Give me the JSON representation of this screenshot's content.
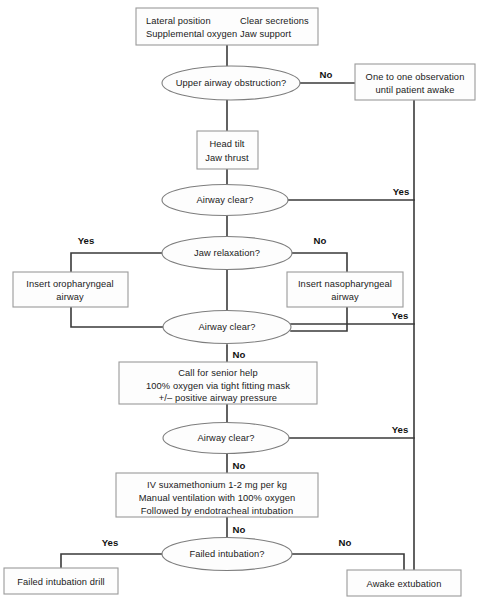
{
  "diagram": {
    "type": "flowchart",
    "colors": {
      "box_fill": "#fdfdfd",
      "box_stroke": "#9a9a9a",
      "ellipse_stroke": "#7d7d7d",
      "connector": "#3a3a3a",
      "text": "#1a1a1a",
      "background": "#ffffff"
    }
  },
  "nodes": {
    "initial_measures": {
      "shape": "box",
      "col_left": [
        "Lateral position",
        "Supplemental oxygen"
      ],
      "col_right": [
        "Clear secretions",
        "Jaw support"
      ]
    },
    "upper_airway_obstruction": {
      "shape": "ellipse",
      "label": "Upper airway obstruction?"
    },
    "one_to_one_observation": {
      "shape": "box",
      "lines": [
        "One to one observation",
        "until patient awake"
      ]
    },
    "head_tilt": {
      "shape": "box",
      "lines": [
        "Head tilt",
        "Jaw thrust"
      ]
    },
    "airway_clear_1": {
      "shape": "ellipse",
      "label": "Airway clear?"
    },
    "jaw_relaxation": {
      "shape": "ellipse",
      "label": "Jaw relaxation?"
    },
    "insert_oropharyngeal": {
      "shape": "box",
      "lines": [
        "Insert oropharyngeal",
        "airway"
      ]
    },
    "insert_nasopharyngeal": {
      "shape": "box",
      "lines": [
        "Insert nasopharyngeal",
        "airway"
      ]
    },
    "airway_clear_2": {
      "shape": "ellipse",
      "label": "Airway clear?"
    },
    "senior_help": {
      "shape": "box",
      "lines": [
        "Call for senior help",
        "100% oxygen via tight fitting mask",
        "+/– positive airway pressure"
      ]
    },
    "airway_clear_3": {
      "shape": "ellipse",
      "label": "Airway clear?"
    },
    "iv_suxamethonium": {
      "shape": "box",
      "lines": [
        "IV suxamethonium 1-2 mg per kg",
        "Manual ventilation with 100% oxygen",
        "Followed by endotracheal intubation"
      ]
    },
    "failed_intubation": {
      "shape": "ellipse",
      "label": "Failed intubation?"
    },
    "failed_intubation_drill": {
      "shape": "box",
      "lines": [
        "Failed intubation drill"
      ]
    },
    "awake_extubation": {
      "shape": "box",
      "lines": [
        "Awake extubation"
      ]
    }
  },
  "edge_labels": {
    "obstruction_no": "No",
    "airway_clear_1_yes": "Yes",
    "jaw_relaxation_yes": "Yes",
    "jaw_relaxation_no": "No",
    "airway_clear_2_yes": "Yes",
    "airway_clear_2_no": "No",
    "airway_clear_3_yes": "Yes",
    "airway_clear_3_no": "No",
    "intubation_no": "No",
    "failed_intubation_yes": "Yes",
    "failed_intubation_no": "No"
  }
}
